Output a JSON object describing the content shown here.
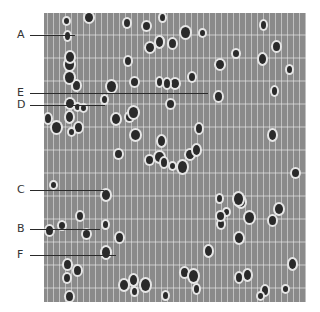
{
  "figure": {
    "labels": [
      {
        "letter": "A",
        "y": 35,
        "x_end": 75
      },
      {
        "letter": "E",
        "y": 93,
        "x_end": 208
      },
      {
        "letter": "D",
        "y": 105,
        "x_end": 105
      },
      {
        "letter": "C",
        "y": 190,
        "x_end": 104
      },
      {
        "letter": "B",
        "y": 229,
        "x_end": 100
      },
      {
        "letter": "F",
        "y": 255,
        "x_end": 116
      }
    ]
  }
}
